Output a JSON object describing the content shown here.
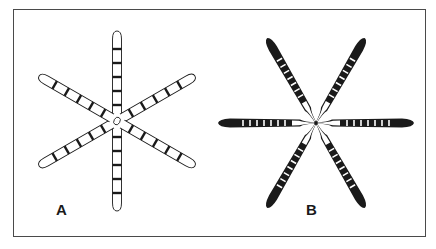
{
  "figure": {
    "panels": [
      {
        "label": "A",
        "description": "Six-armed radial chromosome figure with open (white) arms and dark transverse bands",
        "arm_style": "outline-white",
        "band_color": "#1a1a1a"
      },
      {
        "label": "B",
        "description": "Six-armed radial chromosome figure with solid dark arms, white transverse bands and thin pinched centers",
        "arm_style": "solid-dark",
        "band_color": "#ffffff"
      }
    ],
    "colors": {
      "ink": "#1a1a1a",
      "frame": "#4a4a4a",
      "background": "#ffffff"
    }
  }
}
